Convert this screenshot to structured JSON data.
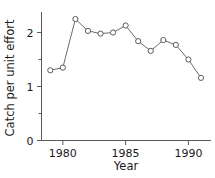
{
  "chart_data": {
    "type": "line",
    "title": "",
    "xlabel": "Year",
    "ylabel": "Catch per unit effort",
    "x": [
      1979,
      1980,
      1981,
      1982,
      1983,
      1984,
      1985,
      1986,
      1987,
      1988,
      1989,
      1990,
      1991
    ],
    "values": [
      1.3,
      1.35,
      2.25,
      2.03,
      1.98,
      2.0,
      2.13,
      1.84,
      1.66,
      1.86,
      1.77,
      1.5,
      1.16
    ],
    "series": [
      {
        "name": "Catch per unit effort",
        "values": [
          1.3,
          1.35,
          2.25,
          2.03,
          1.98,
          2.0,
          2.13,
          1.84,
          1.66,
          1.86,
          1.77,
          1.5,
          1.16
        ]
      }
    ],
    "xlim": [
      1978.3,
      1991.8
    ],
    "ylim": [
      0,
      2.38
    ],
    "xticks": [
      1980,
      1985,
      1990
    ],
    "xtick_labels": [
      "1980",
      "1985",
      "1990"
    ],
    "yticks": [
      0,
      1,
      2
    ],
    "ytick_labels": [
      "0",
      "1",
      "2"
    ],
    "yminorticks": [
      0.5,
      1.5
    ],
    "grid": false,
    "legend": false,
    "marker": "open-circle",
    "line_color": "#6b6b6b",
    "marker_fill": "#ffffff",
    "marker_stroke": "#5a5a5a",
    "axis_color": "#5a5a5a",
    "background": "#ffffff"
  }
}
